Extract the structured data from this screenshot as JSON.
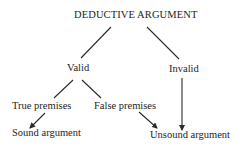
{
  "diagram": {
    "type": "tree",
    "root": {
      "id": "deductive-argument",
      "label": "DEDUCTIVE ARGUMENT"
    },
    "nodes": {
      "valid": {
        "label": "Valid"
      },
      "invalid": {
        "label": "Invalid"
      },
      "true_premises": {
        "label": "True premises"
      },
      "false_premises": {
        "label": "False premises"
      },
      "sound_argument": {
        "label": "Sound argument"
      },
      "unsound_argument": {
        "label": "Unsound argument"
      }
    },
    "edges": [
      {
        "from": "DEDUCTIVE ARGUMENT",
        "to": "Valid",
        "style": "line"
      },
      {
        "from": "DEDUCTIVE ARGUMENT",
        "to": "Invalid",
        "style": "line"
      },
      {
        "from": "Valid",
        "to": "True premises",
        "style": "line"
      },
      {
        "from": "Valid",
        "to": "False premises",
        "style": "line"
      },
      {
        "from": "True premises",
        "to": "Sound argument",
        "style": "arrow"
      },
      {
        "from": "False premises",
        "to": "Unsound argument",
        "style": "arrow"
      },
      {
        "from": "Invalid",
        "to": "Unsound argument",
        "style": "arrow"
      }
    ],
    "colors": {
      "text": "#1e1e1e",
      "line": "#2a2a2a",
      "background": "#ffffff"
    }
  }
}
